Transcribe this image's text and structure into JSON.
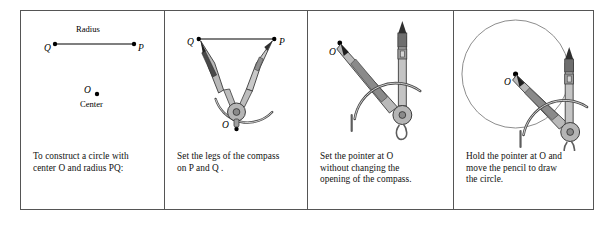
{
  "figure": {
    "kind": "four-step-construction-diagram",
    "topic": "Constructing a circle with a compass",
    "panel_count": 4
  },
  "colors": {
    "border": "#555555",
    "ink": "#000000",
    "caption_ink": "#111111",
    "compass_light": "#c9c9c9",
    "compass_mid": "#9a9a9a",
    "compass_dark": "#5d5d5d",
    "compass_darkest": "#2f2f2f",
    "circle_stroke": "#8d8d8d",
    "paper": "#ffffff"
  },
  "panels": [
    {
      "id": "panel-1",
      "step": 1,
      "caption_lines": [
        "To construct a circle with",
        "center O and radius  PQ:"
      ],
      "caption_plain": "To construct a circle with center O and radius PQ:",
      "labels": {
        "segment_title": "Radius",
        "point_q": "Q",
        "point_p": "P",
        "point_o": "O",
        "center_label": "Center"
      }
    },
    {
      "id": "panel-2",
      "step": 2,
      "caption_lines": [
        "Set the legs of the compass",
        "on P and Q ."
      ],
      "caption_plain": "Set the legs of the compass on P and Q.",
      "labels": {
        "point_q": "Q",
        "point_p": "P",
        "point_o": "O"
      }
    },
    {
      "id": "panel-3",
      "step": 3,
      "caption_lines": [
        "Set the pointer at O",
        "without changing the",
        "opening of the compass."
      ],
      "caption_plain": "Set the pointer at O without changing the opening of the compass.",
      "labels": {
        "point_o": "O"
      }
    },
    {
      "id": "panel-4",
      "step": 4,
      "caption_lines": [
        "Hold the pointer at O and",
        "move the pencil to draw",
        "the circle."
      ],
      "caption_plain": "Hold the pointer at O and move the pencil to draw the circle.",
      "labels": {
        "point_o": "O"
      }
    }
  ]
}
